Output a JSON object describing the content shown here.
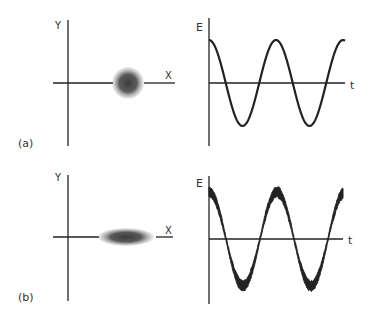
{
  "panels": [
    {
      "id": "a",
      "label": "(a)",
      "left": {
        "y_label": "Y",
        "x_label": "X",
        "spot": "circular"
      },
      "right": {
        "y_label": "E",
        "x_label": "t",
        "signal": "clean-cosine"
      }
    },
    {
      "id": "b",
      "label": "(b)",
      "left": {
        "y_label": "Y",
        "x_label": "X",
        "spot": "elliptical"
      },
      "right": {
        "y_label": "E",
        "x_label": "t",
        "signal": "noisy-cosine"
      }
    }
  ],
  "colors": {
    "axis": "#222222",
    "wave": "#222222",
    "spot": "#4a4a4a",
    "text": "#333333"
  }
}
